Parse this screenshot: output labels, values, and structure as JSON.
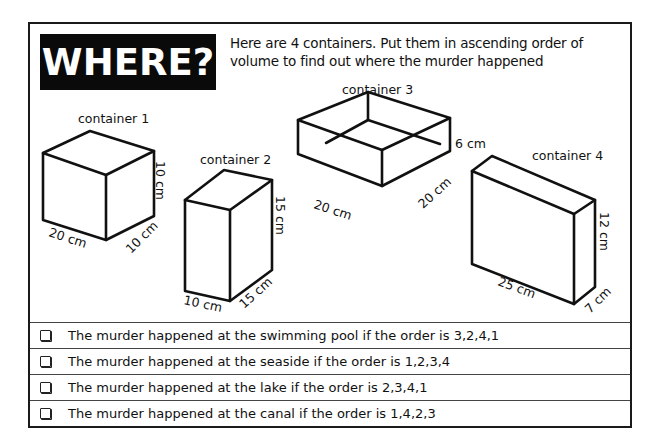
{
  "header": {
    "title": "WHERE?",
    "intro": "Here are 4 containers. Put them in ascending order of volume to find out where the murder happened"
  },
  "containers": [
    {
      "label": "container 1",
      "length": "20 cm",
      "depth": "10 cm",
      "height": "10 cm"
    },
    {
      "label": "container 2",
      "length": "10 cm",
      "depth": "15 cm",
      "height": "15 cm"
    },
    {
      "label": "container 3",
      "length": "20 cm",
      "depth": "20 cm",
      "height": "6 cm",
      "open_top": true
    },
    {
      "label": "container 4",
      "length": "25 cm",
      "depth": "7 cm",
      "height": "12 cm"
    }
  ],
  "options": [
    {
      "text": "The murder happened at the swimming pool if the order is 3,2,4,1",
      "checked": false
    },
    {
      "text": "The murder happened at the seaside if the order is 1,2,3,4",
      "checked": false
    },
    {
      "text": "The murder happened at the lake if the order is 2,3,4,1",
      "checked": false
    },
    {
      "text": "The murder happened at the canal if the order is 1,4,2,3",
      "checked": false
    }
  ],
  "colors": {
    "border": "#1a1a1a",
    "title_bg": "#0a0a0a",
    "title_text": "#ffffff"
  }
}
